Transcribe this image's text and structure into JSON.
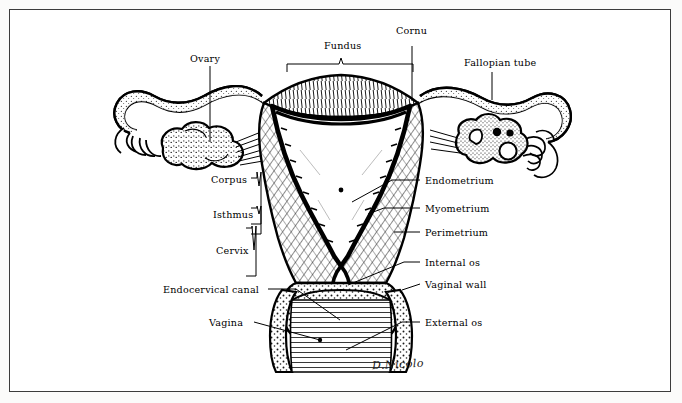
{
  "figure": {
    "title_visible": false,
    "signature": "D.Nicolo",
    "ink_color": "#000000",
    "background_color": "#ffffff",
    "border_color": "#3c3c3c"
  },
  "labels": {
    "ovary": "Ovary",
    "fundus": "Fundus",
    "cornu": "Cornu",
    "fallopian_tube": "Fallopian tube",
    "corpus": "Corpus",
    "isthmus": "Isthmus",
    "cervix": "Cervix",
    "endocervical_canal": "Endocervical canal",
    "vagina": "Vagina",
    "endometrium": "Endometrium",
    "myometrium": "Myometrium",
    "perimetrium": "Perimetrium",
    "internal_os": "Internal os",
    "vaginal_wall": "Vaginal wall",
    "external_os": "External os"
  },
  "label_layout": {
    "left_column": [
      "Corpus",
      "Isthmus",
      "Cervix",
      "Endocervical canal",
      "Vagina"
    ],
    "right_column": [
      "Endometrium",
      "Myometrium",
      "Perimetrium",
      "Internal os",
      "Vaginal wall",
      "External os"
    ],
    "top_row": [
      "Ovary",
      "Fundus",
      "Cornu",
      "Fallopian tube"
    ]
  },
  "braces": [
    {
      "label": "Fundus",
      "orientation": "horizontal-down"
    },
    {
      "label": "Corpus",
      "orientation": "vertical-right"
    },
    {
      "label": "Isthmus",
      "orientation": "vertical-right"
    },
    {
      "label": "Cervix",
      "orientation": "vertical-right"
    }
  ]
}
